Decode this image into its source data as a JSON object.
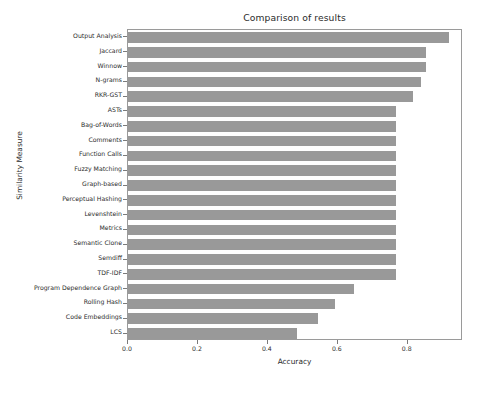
{
  "chart_data": {
    "type": "bar",
    "orientation": "horizontal",
    "title": "Comparison of results",
    "xlabel": "Accuracy",
    "ylabel": "Similarity Measure",
    "grid": false,
    "legend": null,
    "xlim": [
      0.0,
      0.958
    ],
    "xticks": [
      "0.0",
      "0.2",
      "0.4",
      "0.6",
      "0.8"
    ],
    "xtick_values": [
      0.0,
      0.2,
      0.4,
      0.6,
      0.8
    ],
    "bar_color": "#999999",
    "categories": [
      "Output Analysis",
      "Jaccard",
      "Winnow",
      "N-grams",
      "RKR-GST",
      "ASTs",
      "Bag-of-Words",
      "Comments",
      "Function Calls",
      "Fuzzy Matching",
      "Graph-based",
      "Perceptual Hashing",
      "Levenshtein",
      "Metrics",
      "Semantic Clone",
      "Semdiff",
      "TDF-IDF",
      "Program Dependence Graph",
      "Rolling Hash",
      "Code Embeddings",
      "LCS"
    ],
    "values": [
      0.917,
      0.853,
      0.853,
      0.837,
      0.814,
      0.766,
      0.766,
      0.766,
      0.766,
      0.766,
      0.766,
      0.766,
      0.766,
      0.766,
      0.766,
      0.766,
      0.766,
      0.645,
      0.592,
      0.543,
      0.483
    ]
  }
}
